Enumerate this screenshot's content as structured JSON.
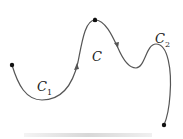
{
  "figure": {
    "labels": {
      "c1": {
        "main": "C",
        "sub": "1"
      },
      "c": {
        "main": "C"
      },
      "c2": {
        "main": "C",
        "sub": "2"
      }
    },
    "colors": {
      "curve": "#555555",
      "point": "#111111"
    },
    "points": [
      {
        "name": "start-point",
        "x": 12,
        "y": 65
      },
      {
        "name": "junction-point",
        "x": 95,
        "y": 20
      },
      {
        "name": "end-point",
        "x": 164,
        "y": 125
      }
    ]
  }
}
